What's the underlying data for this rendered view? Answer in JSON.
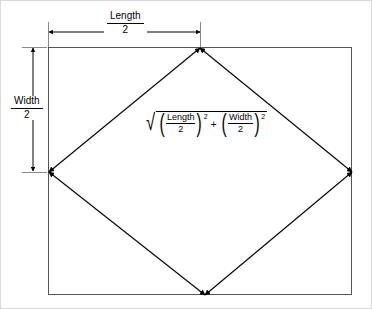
{
  "figure": {
    "background_color": "#ffffff",
    "line_color": "#000000",
    "frame_color": "#c8c8c8"
  },
  "rectangle": {
    "name": "outer-rectangle",
    "left": 48,
    "top": 47,
    "right": 352,
    "bottom": 295,
    "width": 304,
    "height": 248
  },
  "diamond": {
    "name": "inscribed-diamond",
    "vertices": [
      {
        "label": "top",
        "x": 200,
        "y": 48
      },
      {
        "label": "right",
        "x": 352,
        "y": 172
      },
      {
        "label": "bottom",
        "x": 205,
        "y": 295
      },
      {
        "label": "left",
        "x": 49,
        "y": 172
      }
    ],
    "edge_arrows": "double-headed"
  },
  "dimensions": {
    "length_half": {
      "name": "length-over-two",
      "numerator": "Length",
      "denominator": "2",
      "orientation": "horizontal",
      "from_x": 48,
      "to_x": 201,
      "y": 32
    },
    "width_half": {
      "name": "width-over-two",
      "numerator": "Width",
      "denominator": "2",
      "orientation": "vertical",
      "x": 33,
      "from_y": 47,
      "to_y": 172
    }
  },
  "formula": {
    "name": "distance-formula",
    "radical_symbol": "√",
    "plain_text": "sqrt((Length/2)^2 + (Width/2)^2)",
    "terms": [
      {
        "numerator": "Length",
        "denominator": "2",
        "exponent": "2"
      },
      {
        "numerator": "Width",
        "denominator": "2",
        "exponent": "2"
      }
    ],
    "operator": "+",
    "exponent": "2"
  }
}
